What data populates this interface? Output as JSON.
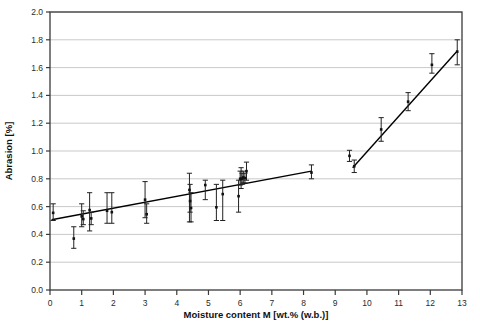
{
  "chart_data": {
    "type": "scatter",
    "title": "",
    "xlabel": "Moisture content M [wt.% (w.b.)]",
    "ylabel": "Abrasion [%]",
    "xlim": [
      0,
      13
    ],
    "ylim": [
      0.0,
      2.0
    ],
    "xticks": [
      0,
      1,
      2,
      3,
      4,
      5,
      6,
      7,
      8,
      9,
      10,
      11,
      12,
      13
    ],
    "xtick_labels": [
      "0",
      "1",
      "2",
      "3",
      "4",
      "5",
      "6",
      "7",
      "8",
      "9",
      "10",
      "11",
      "12",
      "13"
    ],
    "yticks": [
      0.0,
      0.2,
      0.4,
      0.6,
      0.8,
      1.0,
      1.2,
      1.4,
      1.6,
      1.8,
      2.0
    ],
    "ytick_labels": [
      "0.0",
      "0.2",
      "0.4",
      "0.6",
      "0.8",
      "1.0",
      "1.2",
      "1.4",
      "1.6",
      "1.8",
      "2.0"
    ],
    "grid": "horizontal",
    "legend": "none",
    "marker": "square",
    "marker_color": "#111111",
    "errorbar_color": "#222222",
    "fit_line_color": "#000000",
    "points": [
      {
        "x": 0.1,
        "y": 0.555,
        "yerr_low": 0.5,
        "yerr_high": 0.62
      },
      {
        "x": 0.75,
        "y": 0.37,
        "yerr_low": 0.3,
        "yerr_high": 0.455
      },
      {
        "x": 1.0,
        "y": 0.53,
        "yerr_low": 0.455,
        "yerr_high": 0.62
      },
      {
        "x": 1.05,
        "y": 0.51,
        "yerr_low": 0.47,
        "yerr_high": 0.57
      },
      {
        "x": 1.25,
        "y": 0.575,
        "yerr_low": 0.425,
        "yerr_high": 0.7
      },
      {
        "x": 1.3,
        "y": 0.515,
        "yerr_low": 0.47,
        "yerr_high": 0.56
      },
      {
        "x": 1.8,
        "y": 0.57,
        "yerr_low": 0.48,
        "yerr_high": 0.7
      },
      {
        "x": 1.95,
        "y": 0.56,
        "yerr_low": 0.48,
        "yerr_high": 0.7
      },
      {
        "x": 3.0,
        "y": 0.65,
        "yerr_low": 0.52,
        "yerr_high": 0.78
      },
      {
        "x": 3.05,
        "y": 0.545,
        "yerr_low": 0.48,
        "yerr_high": 0.62
      },
      {
        "x": 4.4,
        "y": 0.72,
        "yerr_low": 0.49,
        "yerr_high": 0.84
      },
      {
        "x": 4.42,
        "y": 0.64,
        "yerr_low": 0.56,
        "yerr_high": 0.76
      },
      {
        "x": 4.45,
        "y": 0.59,
        "yerr_low": 0.49,
        "yerr_high": 0.7
      },
      {
        "x": 4.9,
        "y": 0.755,
        "yerr_low": 0.65,
        "yerr_high": 0.79
      },
      {
        "x": 5.25,
        "y": 0.595,
        "yerr_low": 0.5,
        "yerr_high": 0.76
      },
      {
        "x": 5.45,
        "y": 0.69,
        "yerr_low": 0.5,
        "yerr_high": 0.79
      },
      {
        "x": 5.95,
        "y": 0.675,
        "yerr_low": 0.56,
        "yerr_high": 0.79
      },
      {
        "x": 6.0,
        "y": 0.8,
        "yerr_low": 0.755,
        "yerr_high": 0.855
      },
      {
        "x": 6.03,
        "y": 0.8,
        "yerr_low": 0.73,
        "yerr_high": 0.88
      },
      {
        "x": 6.06,
        "y": 0.8,
        "yerr_low": 0.76,
        "yerr_high": 0.84
      },
      {
        "x": 6.1,
        "y": 0.81,
        "yerr_low": 0.77,
        "yerr_high": 0.855
      },
      {
        "x": 6.15,
        "y": 0.805,
        "yerr_low": 0.77,
        "yerr_high": 0.84
      },
      {
        "x": 6.2,
        "y": 0.855,
        "yerr_low": 0.79,
        "yerr_high": 0.92
      },
      {
        "x": 8.25,
        "y": 0.845,
        "yerr_low": 0.8,
        "yerr_high": 0.9
      },
      {
        "x": 9.45,
        "y": 0.965,
        "yerr_low": 0.925,
        "yerr_high": 1.005
      },
      {
        "x": 9.6,
        "y": 0.89,
        "yerr_low": 0.845,
        "yerr_high": 0.935
      },
      {
        "x": 10.45,
        "y": 1.155,
        "yerr_low": 1.07,
        "yerr_high": 1.24
      },
      {
        "x": 11.3,
        "y": 1.355,
        "yerr_low": 1.29,
        "yerr_high": 1.42
      },
      {
        "x": 12.05,
        "y": 1.62,
        "yerr_low": 1.56,
        "yerr_high": 1.7
      },
      {
        "x": 12.85,
        "y": 1.715,
        "yerr_low": 1.62,
        "yerr_high": 1.8
      }
    ],
    "fit_lines": [
      {
        "name": "low-moisture-fit",
        "x1": 0.05,
        "y1": 0.505,
        "x2": 8.25,
        "y2": 0.855
      },
      {
        "name": "high-moisture-fit",
        "x1": 9.55,
        "y1": 0.88,
        "x2": 12.85,
        "y2": 1.72
      }
    ]
  }
}
